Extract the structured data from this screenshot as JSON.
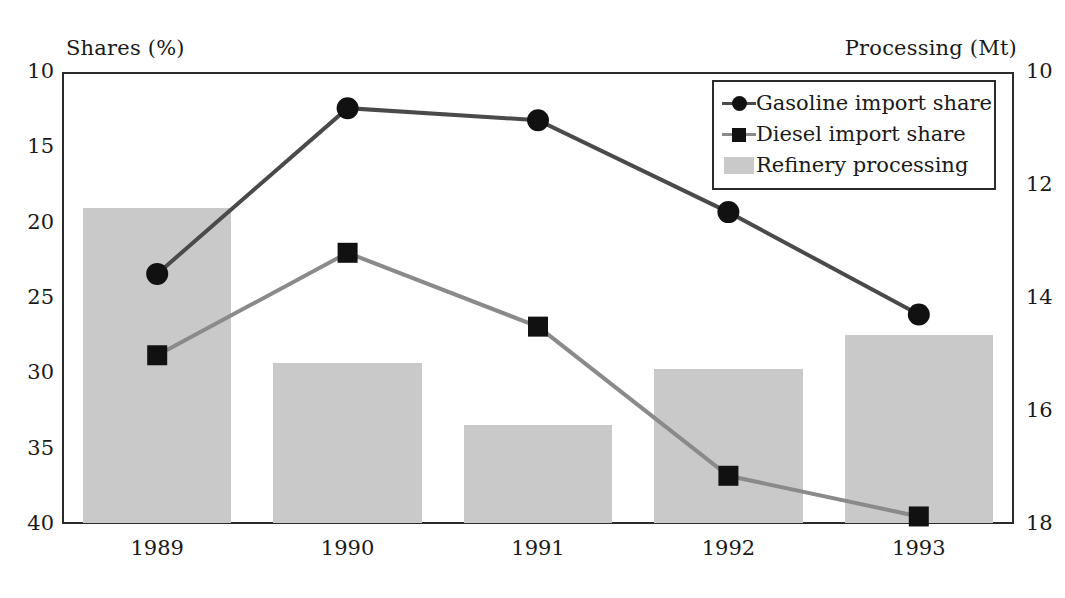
{
  "chart_data": {
    "type": "bar",
    "title": "",
    "subtitle": "",
    "categories": [
      "1989",
      "1990",
      "1991",
      "1992",
      "1993"
    ],
    "x": [
      1989,
      1990,
      1991,
      1992,
      1993
    ],
    "xlabel": "",
    "ylabel": "Shares (%)",
    "y2label": "Processing (Mt)",
    "ylim": [
      10,
      40
    ],
    "y2lim": [
      10,
      18
    ],
    "yticks": [
      10,
      15,
      20,
      25,
      30,
      35,
      40
    ],
    "y2ticks": [
      10,
      12,
      14,
      16,
      18
    ],
    "grid": false,
    "legend_position": "top-right",
    "series": [
      {
        "name": "Gasoline import share",
        "type": "line",
        "axis": "left",
        "marker": "circle",
        "color": "#4a4a4a",
        "marker_color": "#111111",
        "values": [
          26.6,
          37.6,
          36.8,
          30.7,
          23.9
        ]
      },
      {
        "name": "Diesel import share",
        "type": "line",
        "axis": "left",
        "marker": "square",
        "color": "#8a8a8a",
        "marker_color": "#111111",
        "values": [
          21.2,
          28.0,
          23.1,
          13.2,
          10.5
        ]
      },
      {
        "name": "Refinery processing",
        "type": "bar",
        "axis": "right",
        "color": "#c9c9c9",
        "values": [
          15.6,
          12.85,
          11.75,
          12.75,
          13.35
        ]
      }
    ]
  },
  "axes": {
    "left_title": "Shares (%)",
    "right_title": "Processing (Mt)",
    "left_ticks": [
      "40",
      "35",
      "30",
      "25",
      "20",
      "15",
      "10"
    ],
    "right_ticks": [
      "18",
      "16",
      "14",
      "12",
      "10"
    ],
    "x_ticks": [
      "1989",
      "1990",
      "1991",
      "1992",
      "1993"
    ]
  },
  "legend": {
    "items": [
      {
        "label": "Gasoline import share",
        "marker": "circle",
        "swatch": "line-marker"
      },
      {
        "label": "Diesel import share",
        "marker": "square",
        "swatch": "line-marker"
      },
      {
        "label": "Refinery processing",
        "marker": "bar",
        "swatch": "bar"
      }
    ]
  },
  "colors": {
    "bar": "#c9c9c9",
    "gasoline_line": "#4a4a4a",
    "diesel_line": "#8a8a8a",
    "marker": "#111111",
    "frame": "#2b2b2b",
    "background": "#ffffff"
  }
}
